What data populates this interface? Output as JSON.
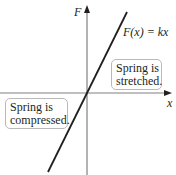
{
  "diagram": {
    "axes": {
      "y_label": "F",
      "x_label": "x"
    },
    "line_label": "F(x) = kx",
    "regions": {
      "stretched": {
        "line1": "Spring is",
        "line2": "stretched."
      },
      "compressed": {
        "line1": "Spring is",
        "line2": "compressed."
      }
    },
    "colors": {
      "axis": "#808080",
      "line": "#231f20",
      "box_border": "#b9b9b9"
    }
  }
}
